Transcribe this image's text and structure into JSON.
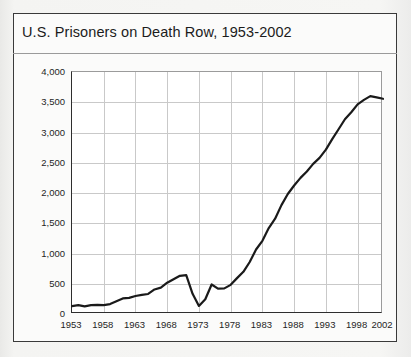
{
  "figure": {
    "title": "U.S. Prisoners on Death Row, 1953-2002",
    "frame_color": "#3a3a3a",
    "background_color": "#fbfbfa",
    "plot_background_color": "#ffffff",
    "grid_color": "#c9c9c9",
    "line_color": "#1a1a1a"
  },
  "chart_data": {
    "type": "line",
    "title": "U.S. Prisoners on Death Row, 1953-2002",
    "xlabel": "",
    "ylabel": "",
    "xlim": [
      1953,
      2002
    ],
    "ylim": [
      0,
      4000
    ],
    "grid": true,
    "legend": "none",
    "y_ticks": [
      0,
      500,
      1000,
      1500,
      2000,
      2500,
      3000,
      3500,
      4000
    ],
    "y_tick_labels": [
      "0",
      "500",
      "1,000",
      "1,500",
      "2,000",
      "2,500",
      "3,000",
      "3,500",
      "4,000"
    ],
    "x_ticks": [
      1953,
      1958,
      1963,
      1968,
      1973,
      1978,
      1983,
      1988,
      1993,
      1998,
      2002
    ],
    "x_tick_labels": [
      "1953",
      "1958",
      "1963",
      "1968",
      "1973",
      "1978",
      "1983",
      "1988",
      "1993",
      "1998",
      "2002"
    ],
    "series": [
      {
        "name": "Prisoners on death row",
        "x": [
          1953,
          1954,
          1955,
          1956,
          1957,
          1958,
          1959,
          1960,
          1961,
          1962,
          1963,
          1964,
          1965,
          1966,
          1967,
          1968,
          1969,
          1970,
          1971,
          1972,
          1973,
          1974,
          1975,
          1976,
          1977,
          1978,
          1979,
          1980,
          1981,
          1982,
          1983,
          1984,
          1985,
          1986,
          1987,
          1988,
          1989,
          1990,
          1991,
          1992,
          1993,
          1994,
          1995,
          1996,
          1997,
          1998,
          1999,
          2000,
          2001,
          2002
        ],
        "values": [
          131,
          147,
          125,
          146,
          151,
          147,
          164,
          210,
          257,
          267,
          297,
          315,
          331,
          406,
          435,
          517,
          575,
          631,
          642,
          334,
          134,
          244,
          488,
          420,
          423,
          482,
          593,
          697,
          860,
          1066,
          1209,
          1420,
          1575,
          1800,
          1984,
          2124,
          2250,
          2356,
          2482,
          2580,
          2716,
          2890,
          3054,
          3219,
          3335,
          3465,
          3540,
          3601,
          3581,
          3557
        ]
      }
    ]
  }
}
